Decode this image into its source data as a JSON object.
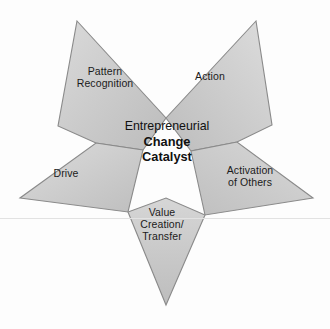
{
  "diagram": {
    "type": "five-point-star",
    "center": {
      "line1": "Entrepreneurial",
      "line2": "Change",
      "line3": "Catalyst"
    },
    "points": [
      {
        "id": "pattern-recognition",
        "label": "Pattern\nRecognition",
        "position": "upper-left"
      },
      {
        "id": "action",
        "label": "Action",
        "position": "upper-right"
      },
      {
        "id": "activation-of-others",
        "label": "Activation\nof Others",
        "position": "right"
      },
      {
        "id": "value-creation",
        "label": "Value\nCreation/\nTransfer",
        "position": "bottom"
      },
      {
        "id": "drive",
        "label": "Drive",
        "position": "left"
      }
    ],
    "colors": {
      "shape_fill_light": "#d5d5d5",
      "shape_fill_dark": "#bcbcbc",
      "shape_stroke": "#8a8a8a",
      "center_fill": "#ffffff",
      "text": "#1b1b1b",
      "background": "#fdfdfd",
      "scanline": "#e2e2e2"
    }
  }
}
